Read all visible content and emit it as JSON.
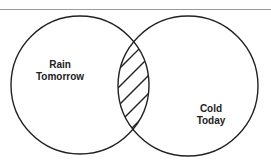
{
  "diagram": {
    "type": "venn",
    "sets": [
      {
        "id": "A",
        "label_lines": [
          "Rain",
          "Tomorrow"
        ]
      },
      {
        "id": "B",
        "label_lines": [
          "Cold",
          "Today"
        ]
      }
    ],
    "intersection": {
      "sets": [
        "A",
        "B"
      ],
      "style": "hatched"
    }
  },
  "colors": {
    "stroke": "#222222",
    "rule": "#9a9a9a",
    "background": "#ffffff"
  }
}
